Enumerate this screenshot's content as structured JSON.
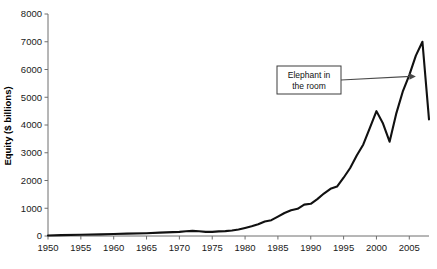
{
  "chart_data": {
    "type": "line",
    "title": "",
    "xlabel": "",
    "ylabel": "Equity ($ billions)",
    "xlim": [
      1950,
      2008
    ],
    "ylim": [
      0,
      8000
    ],
    "grid": false,
    "legend": null,
    "xticks": [
      1950,
      1955,
      1960,
      1965,
      1970,
      1975,
      1980,
      1985,
      1990,
      1995,
      2000,
      2005
    ],
    "yticks": [
      0,
      1000,
      2000,
      3000,
      4000,
      5000,
      6000,
      7000,
      8000
    ],
    "series": [
      {
        "name": "Equity",
        "x": [
          1950,
          1952,
          1955,
          1958,
          1960,
          1962,
          1965,
          1967,
          1969,
          1970,
          1971,
          1972,
          1973,
          1974,
          1975,
          1976,
          1977,
          1978,
          1979,
          1980,
          1981,
          1982,
          1983,
          1984,
          1985,
          1986,
          1987,
          1988,
          1989,
          1990,
          1991,
          1992,
          1993,
          1994,
          1995,
          1996,
          1997,
          1998,
          1999,
          2000,
          2001,
          2002,
          2003,
          2004,
          2005,
          2006,
          2007,
          2008
        ],
        "values": [
          20,
          30,
          45,
          60,
          70,
          85,
          100,
          120,
          140,
          150,
          170,
          185,
          170,
          150,
          150,
          165,
          175,
          200,
          235,
          290,
          350,
          420,
          520,
          570,
          700,
          830,
          930,
          980,
          1130,
          1160,
          1330,
          1530,
          1700,
          1780,
          2100,
          2450,
          2900,
          3300,
          3900,
          4500,
          4050,
          3400,
          4400,
          5200,
          5800,
          6500,
          7000,
          4200
        ]
      }
    ],
    "annotations": [
      {
        "name": "elephant-in-the-room",
        "lines": [
          "Elephant in",
          "the room"
        ],
        "points_to_x": 2006,
        "points_to_y": 5750
      }
    ],
    "colors": {
      "line": "#111111",
      "axis": "#6f6f6f",
      "text": "#1a1a1a",
      "annotation_border": "#3c3c3c",
      "arrow": "#4a4a4a",
      "background": "#ffffff"
    }
  }
}
